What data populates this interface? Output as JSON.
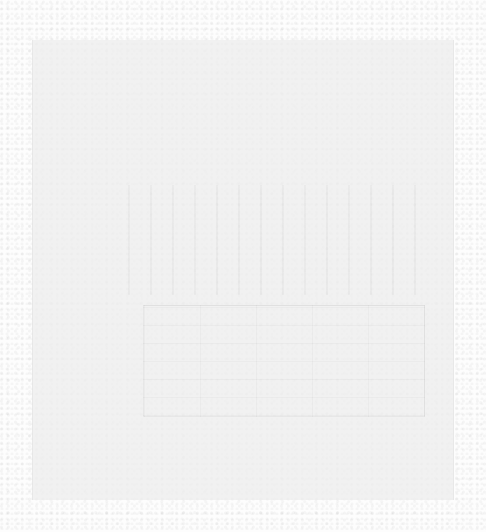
{
  "document": {
    "legibility": "illegible",
    "header_lines": [
      "",
      ""
    ],
    "grid_region_text": "",
    "block_region_text": ""
  },
  "colors": {
    "background": "#fdfdfd",
    "panel": "#eeeeee",
    "faint_ink": "#c4c4c4"
  }
}
